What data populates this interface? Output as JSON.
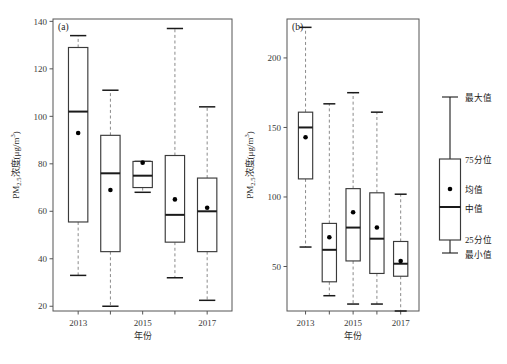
{
  "figure": {
    "width": 507,
    "height": 364,
    "background": "#ffffff"
  },
  "chart_data": [
    {
      "type": "box",
      "panel_label": "(a)",
      "title": "",
      "xlabel": "年份",
      "ylabel": "PM2.5浓度(μg/m³)",
      "ylabel_parts": {
        "prefix": "PM",
        "subscript": "2.5",
        "rest": "浓度(μg/m",
        "superscript": "3",
        "suffix": ")"
      },
      "categories": [
        "2013",
        "2014",
        "2015",
        "2016",
        "2017"
      ],
      "xtick_labels": [
        "2013",
        "2015",
        "2017"
      ],
      "xtick_categories": [
        "2013",
        "2015",
        "2017"
      ],
      "ylim": [
        18,
        141
      ],
      "yticks": [
        20,
        40,
        60,
        80,
        100,
        120,
        140
      ],
      "grid": false,
      "legend": "none",
      "boxes": [
        {
          "category": "2013",
          "min": 33,
          "q1": 55.5,
          "median": 102,
          "mean": 93,
          "q3": 129,
          "max": 134
        },
        {
          "category": "2014",
          "min": 20,
          "q1": 43,
          "median": 76,
          "mean": 69,
          "q3": 92,
          "max": 111
        },
        {
          "category": "2015",
          "min": 68,
          "q1": 70,
          "median": 75,
          "mean": 80.5,
          "q3": 81,
          "max": 81
        },
        {
          "category": "2016",
          "min": 32,
          "q1": 47,
          "median": 58.5,
          "mean": 65,
          "q3": 83.5,
          "max": 137
        },
        {
          "category": "2017",
          "min": 22.5,
          "q1": 43,
          "median": 60,
          "mean": 61.5,
          "q3": 74,
          "max": 104
        }
      ]
    },
    {
      "type": "box",
      "panel_label": "(b)",
      "title": "",
      "xlabel": "年份",
      "ylabel": "PM2.5浓度(μg/m³)",
      "ylabel_parts": {
        "prefix": "PM",
        "subscript": "2.5",
        "rest": "浓度(μg/m",
        "superscript": "3",
        "suffix": ")"
      },
      "categories": [
        "2013",
        "2014",
        "2015",
        "2016",
        "2017"
      ],
      "xtick_labels": [
        "2013",
        "2015",
        "2017"
      ],
      "xtick_categories": [
        "2013",
        "2015",
        "2017"
      ],
      "ylim": [
        18,
        228
      ],
      "yticks": [
        50,
        100,
        150,
        200
      ],
      "grid": false,
      "legend": "none",
      "boxes": [
        {
          "category": "2013",
          "min": 64,
          "q1": 113,
          "median": 150,
          "mean": 143,
          "q3": 161,
          "max": 222
        },
        {
          "category": "2014",
          "min": 29,
          "q1": 39,
          "median": 62,
          "mean": 71,
          "q3": 81,
          "max": 167
        },
        {
          "category": "2015",
          "min": 23,
          "q1": 54,
          "median": 78,
          "mean": 89,
          "q3": 106,
          "max": 175
        },
        {
          "category": "2016",
          "min": 23,
          "q1": 45,
          "median": 70,
          "mean": 78,
          "q3": 103,
          "max": 161
        },
        {
          "category": "2017",
          "min": 18,
          "q1": 43,
          "median": 52,
          "mean": 54,
          "q3": 68,
          "max": 102
        }
      ]
    }
  ],
  "legend_panel": {
    "name": "boxplot-legend",
    "items": [
      {
        "key": "max",
        "label": "最大值"
      },
      {
        "key": "q3",
        "label": "75分位"
      },
      {
        "key": "mean",
        "label": "均值"
      },
      {
        "key": "median",
        "label": "中值"
      },
      {
        "key": "q1",
        "label": "25分位"
      },
      {
        "key": "min",
        "label": "最小值"
      }
    ]
  },
  "colors": {
    "box_stroke": "#3a3a3a",
    "median_stroke": "#1a1a1a",
    "whisker_stroke": "#8a8a8a",
    "frame_stroke": "#555555",
    "mean_marker": "#000000",
    "text": "#1a1a1a"
  }
}
